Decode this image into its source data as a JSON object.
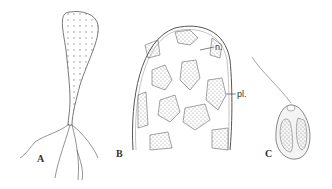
{
  "figure": {
    "panels": [
      {
        "id": "A",
        "label": "A",
        "description": "club-shaped cell with branching rhizoids"
      },
      {
        "id": "B",
        "label": "B",
        "description": "cell tip showing chloroplasts and nuclei",
        "annotations": [
          {
            "label": "n."
          },
          {
            "label": "pl."
          }
        ]
      },
      {
        "id": "C",
        "label": "C",
        "description": "biflagellate zoospore"
      }
    ]
  }
}
